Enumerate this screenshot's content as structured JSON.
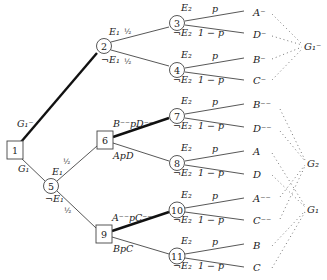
{
  "diagram": {
    "type": "decision-tree",
    "nodes": [
      {
        "id": "1",
        "kind": "decision",
        "x": 15,
        "y": 150
      },
      {
        "id": "2",
        "kind": "chance",
        "x": 104,
        "y": 46
      },
      {
        "id": "3",
        "kind": "chance",
        "x": 177,
        "y": 23
      },
      {
        "id": "4",
        "kind": "chance",
        "x": 177,
        "y": 70
      },
      {
        "id": "5",
        "kind": "chance",
        "x": 51,
        "y": 186
      },
      {
        "id": "6",
        "kind": "decision",
        "x": 105,
        "y": 140
      },
      {
        "id": "7",
        "kind": "chance",
        "x": 177,
        "y": 116
      },
      {
        "id": "8",
        "kind": "chance",
        "x": 177,
        "y": 163
      },
      {
        "id": "9",
        "kind": "decision",
        "x": 104,
        "y": 234
      },
      {
        "id": "10",
        "kind": "chance",
        "x": 177,
        "y": 210
      },
      {
        "id": "11",
        "kind": "chance",
        "x": 177,
        "y": 256
      }
    ],
    "edge_labels": {
      "n1_up": "G₁⁻",
      "n1_down": "G₁",
      "n2_up_event": "E₁",
      "n2_up_prob": "½",
      "n2_down_event": "¬E₁",
      "n2_down_prob": "½",
      "n5_up_event": "E₁",
      "n5_up_prob": "½",
      "n5_down_event": "¬E₁",
      "n5_down_prob": "½",
      "n6_up": "B⁻⁻pD⁻⁻",
      "n6_down": "ApD",
      "n9_up": "A⁻⁻pC⁻⁻",
      "n9_down": "BpC",
      "e2": "E₂",
      "not_e2": "¬E₂",
      "p": "p",
      "one_minus_p": "1 − p"
    },
    "leaves": [
      {
        "label": "A⁻",
        "y": 14
      },
      {
        "label": "D⁻",
        "y": 36
      },
      {
        "label": "B⁻",
        "y": 61
      },
      {
        "label": "C⁻",
        "y": 82
      },
      {
        "label": "B⁻⁻",
        "y": 106
      },
      {
        "label": "D⁻⁻",
        "y": 130
      },
      {
        "label": "A",
        "y": 153
      },
      {
        "label": "D",
        "y": 176
      },
      {
        "label": "A⁻⁻",
        "y": 200
      },
      {
        "label": "C⁻⁻",
        "y": 222
      },
      {
        "label": "B",
        "y": 247
      },
      {
        "label": "C",
        "y": 269
      }
    ],
    "groups": [
      {
        "label": "G₁⁻",
        "members": [
          "A⁻",
          "D⁻",
          "B⁻",
          "C⁻"
        ]
      },
      {
        "label": "G₂",
        "members": [
          "B⁻⁻",
          "D⁻⁻",
          "A⁻⁻",
          "C⁻⁻"
        ]
      },
      {
        "label": "G₁",
        "members": [
          "A",
          "D",
          "B",
          "C"
        ]
      }
    ]
  }
}
